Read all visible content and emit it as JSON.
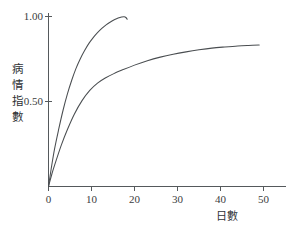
{
  "chart_data": {
    "type": "line",
    "title": "",
    "xlabel": "日數",
    "ylabel": "病情指數",
    "ylabel_chars": [
      "病",
      "情",
      "指",
      "數"
    ],
    "xlim": [
      0,
      55
    ],
    "ylim": [
      0,
      1.05
    ],
    "grid": false,
    "legend": "none",
    "x_ticks": [
      0,
      10,
      20,
      30,
      40,
      50
    ],
    "x_tick_labels": [
      "0",
      "10",
      "20",
      "30",
      "40",
      "50"
    ],
    "y_ticks": [
      0.5,
      1.0
    ],
    "y_tick_labels": [
      "0.50",
      "1.00"
    ],
    "line_color": "#4a4e51",
    "axis_color": "#55595c",
    "background_color": "#ffffff",
    "series": [
      {
        "name": "upper-curve",
        "x": [
          0,
          0.6,
          1.4,
          2.4,
          3.4,
          4.4,
          5.4,
          6.4,
          7.4,
          8.4,
          9.4,
          10.4,
          11.4,
          12.4,
          13.4,
          14.4,
          15.4,
          16.2,
          17.0,
          17.6,
          18.0,
          18.3
        ],
        "y": [
          0.0,
          0.1,
          0.22,
          0.34,
          0.45,
          0.545,
          0.625,
          0.695,
          0.752,
          0.8,
          0.842,
          0.876,
          0.905,
          0.93,
          0.951,
          0.968,
          0.982,
          0.991,
          0.997,
          0.999,
          0.994,
          0.984
        ]
      },
      {
        "name": "lower-curve",
        "x": [
          0,
          0.8,
          1.8,
          3.0,
          4.4,
          6.0,
          7.8,
          9.6,
          11.4,
          13.2,
          15.2,
          17.4,
          20.0,
          23.0,
          26.0,
          29.0,
          32.0,
          35.0,
          38.0,
          41.0,
          44.0,
          46.5,
          49.0
        ],
        "y": [
          0.0,
          0.075,
          0.155,
          0.245,
          0.335,
          0.425,
          0.505,
          0.565,
          0.608,
          0.638,
          0.664,
          0.688,
          0.714,
          0.74,
          0.761,
          0.778,
          0.792,
          0.804,
          0.814,
          0.821,
          0.827,
          0.83,
          0.832
        ]
      }
    ]
  }
}
